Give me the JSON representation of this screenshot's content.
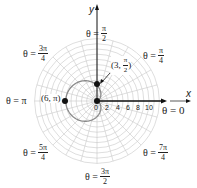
{
  "chart_data": {
    "type": "polar",
    "title": "",
    "equation": "r = 3 - 3cos(theta)",
    "curve": "cardioid",
    "grid": {
      "circles_step": 1,
      "max_radius": 12,
      "spoke_step_deg": 15
    },
    "radial_tick_labels": [
      "0",
      "2",
      "4",
      "6",
      "8",
      "10"
    ],
    "angle_labels": [
      {
        "theta": "0",
        "num": "",
        "den": ""
      },
      {
        "theta": "π/4",
        "num": "π",
        "den": "4"
      },
      {
        "theta": "π/2",
        "num": "π",
        "den": "2"
      },
      {
        "theta": "3π/4",
        "num": "3π",
        "den": "4"
      },
      {
        "theta": "π",
        "num": "",
        "den": ""
      },
      {
        "theta": "5π/4",
        "num": "5π",
        "den": "4"
      },
      {
        "theta": "3π/2",
        "num": "3π",
        "den": "2"
      },
      {
        "theta": "7π/4",
        "num": "7π",
        "den": "4"
      }
    ],
    "points": [
      {
        "label": "(6, π)",
        "r": 6,
        "theta": "π"
      },
      {
        "label": "(3, π/2)",
        "r": 3,
        "theta": "π/2"
      },
      {
        "label": "0",
        "r": 0,
        "theta": "0"
      }
    ],
    "xlabel": "x",
    "ylabel": "y",
    "colors": {
      "grid": "#c8c8c8",
      "curve": "#8a8a8a",
      "axis": "#111111"
    }
  },
  "labels": {
    "x_axis": "x",
    "y_axis": "y",
    "theta_eq": "θ =",
    "theta_0": "θ = 0",
    "theta_pi": "θ = π",
    "pi": "π",
    "num_pi": "π",
    "num_3pi": "3π",
    "num_5pi": "5π",
    "num_7pi": "7π",
    "den_2": "2",
    "den_4": "4",
    "pt_6pi": "(6, π)",
    "pt_3": "(3,",
    "pt_close": ")",
    "ticks": [
      "0",
      "2",
      "4",
      "6",
      "8",
      "10"
    ]
  }
}
